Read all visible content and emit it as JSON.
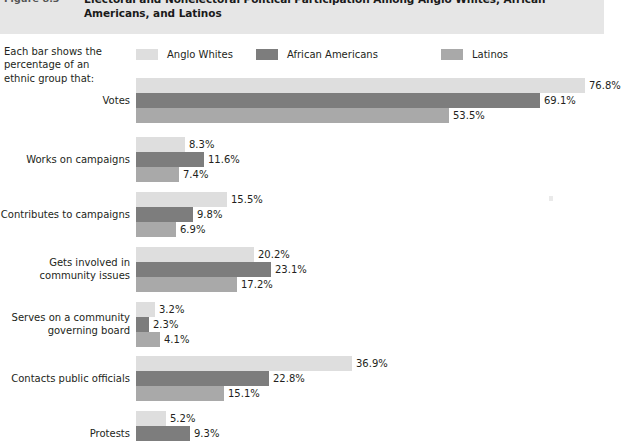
{
  "figure": {
    "label": "Figure 8.3",
    "title": "Electoral and Nonelectoral Political Participation Among Anglo Whites, African Americans, and Latinos"
  },
  "intro_note": "Each bar shows the percentage of an ethnic group that:",
  "colors": {
    "anglo_whites": "#dedede",
    "african_americans": "#7d7d7d",
    "latinos": "#a9a9a9",
    "header_band": "#e6e6e6",
    "text": "#231f20"
  },
  "legend": [
    {
      "label": "Anglo Whites",
      "color_key": "anglo_whites",
      "x": 0
    },
    {
      "label": "African Americans",
      "color_key": "african_americans",
      "x": 120
    },
    {
      "label": "Latinos",
      "color_key": "latinos",
      "x": 305
    }
  ],
  "chart_data": {
    "type": "bar",
    "orientation": "horizontal",
    "title": "Electoral and Nonelectoral Political Participation Among Anglo Whites, African Americans, and Latinos",
    "subtitle": "Each bar shows the percentage of an ethnic group that:",
    "xlabel": "",
    "ylabel": "",
    "xlim": [
      0,
      80
    ],
    "grid": false,
    "legend_position": "top",
    "value_suffix": "%",
    "categories": [
      "Votes",
      "Works on campaigns",
      "Contributes to campaigns",
      "Gets involved in community issues",
      "Serves on a community governing board",
      "Contacts public officials",
      "Protests"
    ],
    "series": [
      {
        "name": "Anglo Whites",
        "values": [
          76.8,
          8.3,
          15.5,
          20.2,
          3.2,
          36.9,
          5.2
        ]
      },
      {
        "name": "African Americans",
        "values": [
          69.1,
          11.6,
          9.8,
          23.1,
          2.3,
          22.8,
          9.3
        ]
      },
      {
        "name": "Latinos",
        "values": [
          53.5,
          7.4,
          6.9,
          17.2,
          4.1,
          15.1,
          null
        ]
      }
    ]
  },
  "groups": [
    {
      "label_lines": [
        "Votes"
      ],
      "top": 44,
      "label_top": 17,
      "rows": [
        {
          "series": "Anglo Whites",
          "value": 76.8,
          "text": "76.8%",
          "color_key": "anglo_whites"
        },
        {
          "series": "African Americans",
          "value": 69.1,
          "text": "69.1%",
          "color_key": "african_americans"
        },
        {
          "series": "Latinos",
          "value": 53.5,
          "text": "53.5%",
          "color_key": "latinos"
        }
      ]
    },
    {
      "label_lines": [
        "Works on campaigns"
      ],
      "top": 103,
      "label_top": 17,
      "rows": [
        {
          "series": "Anglo Whites",
          "value": 8.3,
          "text": "8.3%",
          "color_key": "anglo_whites"
        },
        {
          "series": "African Americans",
          "value": 11.6,
          "text": "11.6%",
          "color_key": "african_americans"
        },
        {
          "series": "Latinos",
          "value": 7.4,
          "text": "7.4%",
          "color_key": "latinos"
        }
      ]
    },
    {
      "label_lines": [
        "Contributes to campaigns"
      ],
      "top": 158,
      "label_top": 17,
      "rows": [
        {
          "series": "Anglo Whites",
          "value": 15.5,
          "text": "15.5%",
          "color_key": "anglo_whites"
        },
        {
          "series": "African Americans",
          "value": 9.8,
          "text": "9.8%",
          "color_key": "african_americans"
        },
        {
          "series": "Latinos",
          "value": 6.9,
          "text": "6.9%",
          "color_key": "latinos"
        }
      ]
    },
    {
      "label_lines": [
        "Gets involved in",
        "community issues"
      ],
      "top": 213,
      "label_top": 10,
      "rows": [
        {
          "series": "Anglo Whites",
          "value": 20.2,
          "text": "20.2%",
          "color_key": "anglo_whites"
        },
        {
          "series": "African Americans",
          "value": 23.1,
          "text": "23.1%",
          "color_key": "african_americans"
        },
        {
          "series": "Latinos",
          "value": 17.2,
          "text": "17.2%",
          "color_key": "latinos"
        }
      ]
    },
    {
      "label_lines": [
        "Serves on a community",
        "governing board"
      ],
      "top": 268,
      "label_top": 10,
      "rows": [
        {
          "series": "Anglo Whites",
          "value": 3.2,
          "text": "3.2%",
          "color_key": "anglo_whites"
        },
        {
          "series": "African Americans",
          "value": 2.3,
          "text": "2.3%",
          "color_key": "african_americans"
        },
        {
          "series": "Latinos",
          "value": 4.1,
          "text": "4.1%",
          "color_key": "latinos"
        }
      ]
    },
    {
      "label_lines": [
        "Contacts public officials"
      ],
      "top": 322,
      "label_top": 17,
      "rows": [
        {
          "series": "Anglo Whites",
          "value": 36.9,
          "text": "36.9%",
          "color_key": "anglo_whites"
        },
        {
          "series": "African Americans",
          "value": 22.8,
          "text": "22.8%",
          "color_key": "african_americans"
        },
        {
          "series": "Latinos",
          "value": 15.1,
          "text": "15.1%",
          "color_key": "latinos"
        }
      ]
    },
    {
      "label_lines": [
        "Protests"
      ],
      "top": 377,
      "label_top": 17,
      "rows": [
        {
          "series": "Anglo Whites",
          "value": 5.2,
          "text": "5.2%",
          "color_key": "anglo_whites"
        },
        {
          "series": "African Americans",
          "value": 9.3,
          "text": "9.3%",
          "color_key": "african_americans"
        }
      ]
    }
  ],
  "scale": {
    "px_per_unit": 5.85,
    "max_bar_px": 449
  }
}
